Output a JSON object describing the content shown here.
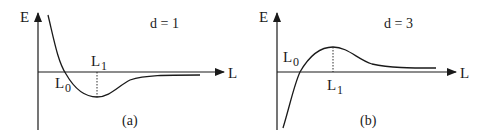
{
  "panels": [
    {
      "id": "a",
      "caption": "(a)",
      "y_axis_label": "E",
      "x_axis_label": "L",
      "param_label": "d = 1",
      "point_labels": {
        "l0": "L",
        "l0_sub": "0",
        "l1": "L",
        "l1_sub": "1"
      },
      "description": "Energy decreases from high values at small L, crosses zero at L0, reaches a minimum at L1, then rises asymptotically to zero from below"
    },
    {
      "id": "b",
      "caption": "(b)",
      "y_axis_label": "E",
      "x_axis_label": "L",
      "param_label": "d = 3",
      "point_labels": {
        "l0": "L",
        "l0_sub": "0",
        "l1": "L",
        "l1_sub": "1"
      },
      "description": "Energy rises from large negative values at small L, crosses zero at L0, reaches a maximum at L1, then decays asymptotically to zero from above"
    }
  ],
  "colors": {
    "ink": "#1a1a1a",
    "background": "#ffffff"
  }
}
